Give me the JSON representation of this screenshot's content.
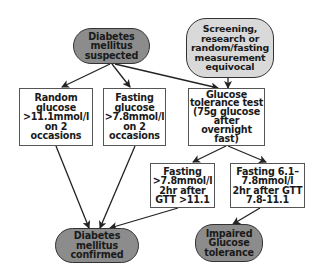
{
  "diagram": {
    "title": "",
    "colors": {
      "dark_node": "#8c8c8c",
      "light_node": "#d9d9d9",
      "box": "#ffffff",
      "arrow": "#222222"
    },
    "nodes": {
      "suspected": {
        "text": "Diabetes\nmellitus\nsuspected",
        "shape": "pill-dark"
      },
      "screening": {
        "text": "Screening,\nresearch or\nrandom/fasting\nmeasurement\nequivocal",
        "shape": "pill-light"
      },
      "random_glucose": {
        "text": "Random\nglucose\n>11.1mmol/l\non 2\noccasions",
        "shape": "rect"
      },
      "fasting_glucose": {
        "text": "Fasting\nglucose\n>7.8mmol/l\non 2\noccasions",
        "shape": "rect"
      },
      "gtt": {
        "text": "Glucose\ntolerance test\n(75g glucose\nafter\novernight\nfast)",
        "shape": "rect"
      },
      "gtt_diabetic": {
        "text": "Fasting\n>7.8mmol/l\n2hr after\nGTT >11.1",
        "shape": "rect"
      },
      "gtt_impaired": {
        "text": "Fasting 6.1–\n7.8mmol/l\n2hr after GTT\n7.8-11.1",
        "shape": "rect"
      },
      "confirmed": {
        "text": "Diabetes\nmellitus\nconfirmed",
        "shape": "pill-dark"
      },
      "impaired": {
        "text": "Impaired\nGlucose\ntolerance",
        "shape": "pill-dark"
      }
    },
    "edges": [
      {
        "from": "suspected",
        "to": "random_glucose"
      },
      {
        "from": "suspected",
        "to": "fasting_glucose"
      },
      {
        "from": "suspected",
        "to": "gtt"
      },
      {
        "from": "screening",
        "to": "gtt"
      },
      {
        "from": "gtt",
        "to": "gtt_diabetic"
      },
      {
        "from": "gtt",
        "to": "gtt_impaired"
      },
      {
        "from": "random_glucose",
        "to": "confirmed"
      },
      {
        "from": "fasting_glucose",
        "to": "confirmed"
      },
      {
        "from": "gtt_diabetic",
        "to": "confirmed"
      },
      {
        "from": "gtt_impaired",
        "to": "impaired"
      }
    ]
  }
}
